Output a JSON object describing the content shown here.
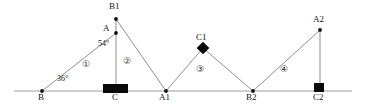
{
  "diagram": {
    "type": "geometric-zigzag-path",
    "baseline": {
      "y": 91,
      "x_start": 14,
      "x_end": 352,
      "color": "#9a9a9a"
    },
    "stroke_color": "#8f8f8f",
    "marker_color": "#000000",
    "vertices": [
      {
        "id": "B",
        "label": "B",
        "x": 42,
        "y": 91,
        "label_dx": -4,
        "label_dy": 6,
        "marker": "dot"
      },
      {
        "id": "A",
        "label": "A",
        "x": 116,
        "y": 33,
        "label_dx": -13,
        "label_dy": -9,
        "marker": "dot"
      },
      {
        "id": "B1",
        "label": "B1",
        "x": 116,
        "y": 19,
        "label_dx": -7,
        "label_dy": -17,
        "marker": "dot"
      },
      {
        "id": "C",
        "label": "C",
        "x": 116,
        "y": 91,
        "label_dx": -4,
        "label_dy": 6,
        "marker": "square"
      },
      {
        "id": "A1",
        "label": "A1",
        "x": 166,
        "y": 91,
        "label_dx": -7,
        "label_dy": 6,
        "marker": "dot"
      },
      {
        "id": "C1",
        "label": "C1",
        "x": 203,
        "y": 48,
        "label_dx": -7,
        "label_dy": -15,
        "marker": "diamond"
      },
      {
        "id": "B2",
        "label": "B2",
        "x": 253,
        "y": 91,
        "label_dx": -7,
        "label_dy": 6,
        "marker": "dot"
      },
      {
        "id": "A2",
        "label": "A2",
        "x": 320,
        "y": 30,
        "label_dx": -7,
        "label_dy": -15,
        "marker": "dot"
      },
      {
        "id": "C2",
        "label": "C2",
        "x": 320,
        "y": 91,
        "label_dx": -7,
        "label_dy": 6,
        "marker": "small-square"
      }
    ],
    "segments": [
      {
        "from": "B",
        "to": "A"
      },
      {
        "from": "A",
        "to": "B1"
      },
      {
        "from": "B1",
        "to": "A1"
      },
      {
        "from": "A",
        "to": "C"
      },
      {
        "from": "A1",
        "to": "C1"
      },
      {
        "from": "C1",
        "to": "B2"
      },
      {
        "from": "B2",
        "to": "A2"
      },
      {
        "from": "A2",
        "to": "C2"
      }
    ],
    "angles": [
      {
        "id": "angle-b",
        "value": "36°",
        "x": 57,
        "y": 79
      },
      {
        "id": "angle-a",
        "value": "54°",
        "x": 98,
        "y": 44
      }
    ],
    "regions": [
      {
        "id": "region-1",
        "label": "①",
        "x": 86,
        "y": 65
      },
      {
        "id": "region-2",
        "label": "②",
        "x": 126,
        "y": 62
      },
      {
        "id": "region-3",
        "label": "③",
        "x": 199,
        "y": 70
      },
      {
        "id": "region-4",
        "label": "④",
        "x": 283,
        "y": 70
      }
    ]
  }
}
